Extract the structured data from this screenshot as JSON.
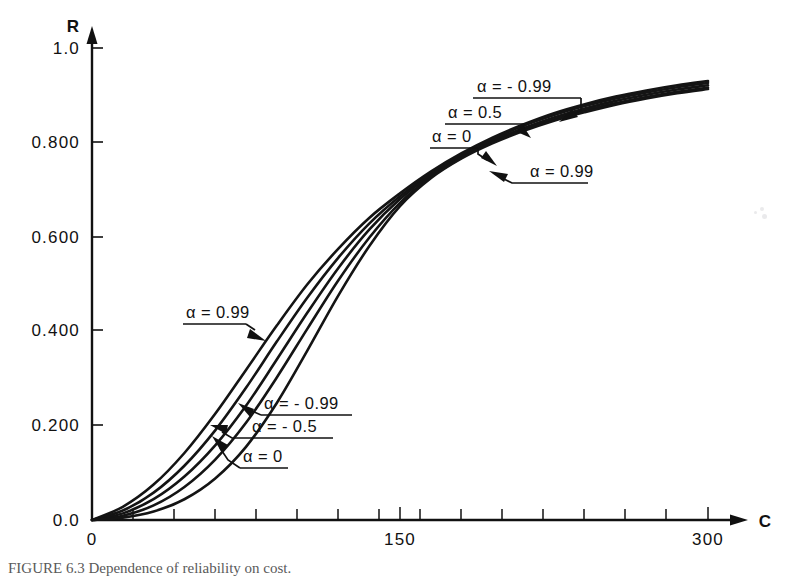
{
  "figure": {
    "caption": "FIGURE 6.3   Dependence of reliability on cost."
  },
  "axes": {
    "y_axis_name": "R",
    "x_axis_name": "C",
    "y_ticks": [
      "1.0",
      "0.800",
      "0.600",
      "0.400",
      "0.200",
      "0.0"
    ],
    "x_ticks": [
      "0",
      "150",
      "300"
    ]
  },
  "annotations": [
    {
      "id": "ann-alpha-neg099-top",
      "text": "α = - 0.99"
    },
    {
      "id": "ann-alpha-05-top",
      "text": "α = 0.5"
    },
    {
      "id": "ann-alpha-0-top",
      "text": "α = 0"
    },
    {
      "id": "ann-alpha-099-right",
      "text": "α = 0.99"
    },
    {
      "id": "ann-alpha-099-left",
      "text": "α = 0.99"
    },
    {
      "id": "ann-alpha-neg099-low",
      "text": "α = - 0.99"
    },
    {
      "id": "ann-alpha-neg05-low",
      "text": "α = - 0.5"
    },
    {
      "id": "ann-alpha-0-low",
      "text": "α = 0"
    }
  ],
  "chart_data": {
    "type": "line",
    "title": "",
    "xlabel": "C",
    "ylabel": "R",
    "xlim": [
      0,
      310
    ],
    "ylim": [
      0,
      1.0
    ],
    "grid": false,
    "legend": "inline-annotations",
    "ytick_values": [
      1.0,
      0.8,
      0.6,
      0.4,
      0.2,
      0.0
    ],
    "xtick_values": [
      0,
      150,
      300
    ],
    "x": [
      0,
      15,
      30,
      45,
      60,
      75,
      90,
      105,
      120,
      135,
      150,
      165,
      180,
      195,
      210,
      225,
      240,
      255,
      270,
      285,
      300
    ],
    "series": [
      {
        "name": "α = 0.99",
        "alpha": 0.99,
        "values": [
          0.0,
          0.028,
          0.075,
          0.142,
          0.225,
          0.318,
          0.412,
          0.5,
          0.575,
          0.64,
          0.692,
          0.738,
          0.777,
          0.81,
          0.838,
          0.862,
          0.881,
          0.897,
          0.91,
          0.921,
          0.93
        ]
      },
      {
        "name": "α = 0.5",
        "alpha": 0.5,
        "values": [
          0.0,
          0.02,
          0.058,
          0.115,
          0.19,
          0.28,
          0.378,
          0.472,
          0.556,
          0.628,
          0.686,
          0.734,
          0.774,
          0.807,
          0.835,
          0.858,
          0.877,
          0.893,
          0.906,
          0.917,
          0.926
        ]
      },
      {
        "name": "α = 0",
        "alpha": 0,
        "values": [
          0.0,
          0.014,
          0.044,
          0.092,
          0.158,
          0.242,
          0.34,
          0.44,
          0.534,
          0.615,
          0.68,
          0.731,
          0.771,
          0.803,
          0.83,
          0.853,
          0.872,
          0.888,
          0.901,
          0.912,
          0.921
        ]
      },
      {
        "name": "α = - 0.5",
        "alpha": -0.5,
        "values": [
          0.0,
          0.009,
          0.031,
          0.07,
          0.128,
          0.206,
          0.302,
          0.406,
          0.508,
          0.598,
          0.672,
          0.727,
          0.768,
          0.8,
          0.827,
          0.849,
          0.868,
          0.883,
          0.896,
          0.907,
          0.916
        ]
      },
      {
        "name": "α = - 0.99",
        "alpha": -0.99,
        "values": [
          0.0,
          0.005,
          0.018,
          0.044,
          0.088,
          0.155,
          0.248,
          0.36,
          0.476,
          0.58,
          0.665,
          0.724,
          0.766,
          0.798,
          0.824,
          0.846,
          0.864,
          0.88,
          0.893,
          0.904,
          0.913
        ]
      }
    ]
  }
}
